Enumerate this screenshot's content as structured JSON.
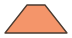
{
  "shape": {
    "type": "trapezoid",
    "fill": "#F4956A",
    "stroke": "#4A3A30",
    "points": "27,5 45,5 67,33 5,33"
  }
}
